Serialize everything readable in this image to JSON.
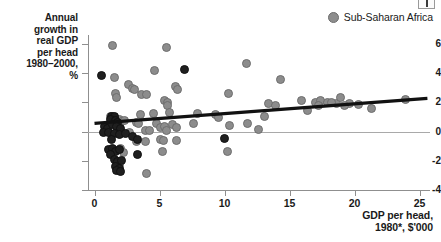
{
  "corner": {
    "name": "page-corner-marker"
  },
  "legend": {
    "position": "top-right",
    "entries": [
      {
        "label": "Sub-Saharan Africa",
        "color": "#8c8c8c",
        "marker": "circle"
      }
    ]
  },
  "axes": {
    "y_title": "Annual\ngrowth in\nreal GDP\nper head\n1980–2000,\n%",
    "x_caption": "GDP per head,\n1980*, $'000",
    "y_ticks": [
      "6",
      "4",
      "2",
      "0",
      "-2",
      "-4"
    ],
    "x_ticks": [
      "0",
      "5",
      "10",
      "15",
      "20",
      "25"
    ]
  },
  "chart_data": {
    "type": "scatter",
    "title": "",
    "subtitle": "",
    "xlabel": "GDP per head, 1980*, $'000",
    "ylabel": "Annual growth in real GDP per head 1980–2000, %",
    "xlim": [
      -0.5,
      25.8
    ],
    "ylim": [
      -4,
      6.6
    ],
    "xticks": [
      0,
      5,
      10,
      15,
      20,
      25
    ],
    "yticks": [
      -4,
      -2,
      0,
      2,
      4,
      6
    ],
    "grid": false,
    "legend_position": "top-right",
    "zero_reference_line": 0,
    "series": [
      {
        "name": "Sub-Saharan Africa",
        "color": "#8c8c8c",
        "points": [
          [
            1.4,
            5.85
          ],
          [
            5.5,
            5.75
          ],
          [
            4.6,
            4.15
          ],
          [
            11.7,
            4.65
          ],
          [
            1.5,
            3.7
          ],
          [
            14.3,
            3.55
          ],
          [
            2.6,
            3.2
          ],
          [
            2.9,
            2.95
          ],
          [
            3.1,
            2.9
          ],
          [
            6.2,
            3.05
          ],
          [
            6.4,
            2.9
          ],
          [
            1.6,
            2.6
          ],
          [
            1.7,
            2.35
          ],
          [
            3.6,
            2.5
          ],
          [
            4.0,
            2.55
          ],
          [
            10.3,
            2.6
          ],
          [
            5.4,
            2.15
          ],
          [
            5.6,
            1.95
          ],
          [
            13.4,
            1.9
          ],
          [
            13.9,
            1.8
          ],
          [
            15.9,
            2.1
          ],
          [
            17.0,
            2.0
          ],
          [
            17.4,
            2.15
          ],
          [
            17.9,
            1.95
          ],
          [
            18.6,
            1.9
          ],
          [
            18.9,
            2.35
          ],
          [
            19.6,
            1.9
          ],
          [
            20.3,
            1.85
          ],
          [
            21.3,
            1.6
          ],
          [
            23.9,
            2.2
          ],
          [
            5.6,
            1.75
          ],
          [
            5.8,
            1.3
          ],
          [
            4.5,
            1.25
          ],
          [
            3.5,
            1.15
          ],
          [
            7.9,
            1.2
          ],
          [
            9.3,
            1.15
          ],
          [
            9.5,
            0.95
          ],
          [
            13.1,
            1.0
          ],
          [
            1.2,
            1.05
          ],
          [
            1.4,
            1.0
          ],
          [
            1.5,
            0.95
          ],
          [
            1.7,
            0.85
          ],
          [
            1.9,
            0.8
          ],
          [
            2.1,
            0.7
          ],
          [
            2.3,
            0.75
          ],
          [
            3.2,
            0.6
          ],
          [
            3.4,
            0.55
          ],
          [
            4.8,
            0.55
          ],
          [
            5.1,
            0.3
          ],
          [
            5.4,
            0.35
          ],
          [
            6.0,
            0.45
          ],
          [
            6.3,
            0.3
          ],
          [
            7.6,
            0.55
          ],
          [
            10.4,
            0.4
          ],
          [
            11.8,
            0.55
          ],
          [
            12.6,
            0.15
          ],
          [
            16.4,
            1.45
          ],
          [
            17.2,
            1.8
          ],
          [
            18.2,
            1.95
          ],
          [
            19.2,
            1.75
          ],
          [
            3.9,
            0.1
          ],
          [
            4.2,
            0.05
          ],
          [
            5.5,
            0.1
          ],
          [
            2.7,
            -0.05
          ],
          [
            3.2,
            -0.65
          ],
          [
            3.9,
            -0.7
          ],
          [
            5.1,
            -0.55
          ],
          [
            5.3,
            -0.6
          ],
          [
            6.3,
            -0.6
          ],
          [
            5.2,
            -1.35
          ],
          [
            10.2,
            -1.35
          ],
          [
            4.0,
            -2.85
          ],
          [
            2.0,
            -1.15
          ],
          [
            2.2,
            -1.45
          ],
          [
            1.9,
            -2.25
          ]
        ]
      },
      {
        "name": "Other countries",
        "color": "#1f1f1f",
        "points": [
          [
            0.55,
            3.8
          ],
          [
            6.9,
            4.25
          ],
          [
            1.3,
            1.0
          ],
          [
            1.5,
            1.05
          ],
          [
            1.2,
            0.85
          ],
          [
            1.6,
            0.75
          ],
          [
            1.8,
            0.6
          ],
          [
            0.8,
            0.35
          ],
          [
            1.0,
            0.2
          ],
          [
            1.35,
            0.45
          ],
          [
            1.7,
            0.35
          ],
          [
            2.0,
            0.2
          ],
          [
            0.7,
            -0.05
          ],
          [
            1.1,
            -0.1
          ],
          [
            1.5,
            -0.15
          ],
          [
            1.9,
            -0.2
          ],
          [
            2.4,
            -0.15
          ],
          [
            2.9,
            -0.35
          ],
          [
            3.3,
            -0.55
          ],
          [
            1.3,
            -0.55
          ],
          [
            1.1,
            -1.2
          ],
          [
            1.4,
            -1.15
          ],
          [
            1.6,
            -1.35
          ],
          [
            1.9,
            -1.25
          ],
          [
            1.2,
            -1.55
          ],
          [
            3.3,
            -1.55
          ],
          [
            1.5,
            -1.9
          ],
          [
            1.8,
            -2.05
          ],
          [
            2.1,
            -1.95
          ],
          [
            1.6,
            -2.4
          ],
          [
            1.9,
            -2.5
          ],
          [
            1.7,
            -2.7
          ],
          [
            2.0,
            -2.75
          ],
          [
            10.0,
            -0.45
          ]
        ]
      }
    ],
    "trend_line": {
      "name": "fitted-trend",
      "color": "#111111",
      "x_start": 0,
      "y_start": 0.55,
      "x_end": 25.6,
      "y_end": 2.27
    }
  }
}
